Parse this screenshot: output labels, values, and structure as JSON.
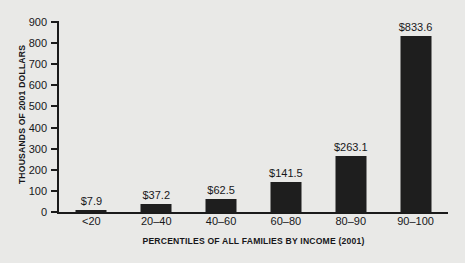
{
  "chart_data": {
    "type": "bar",
    "title": "",
    "xlabel": "PERCENTILES OF ALL FAMILIES BY INCOME (2001)",
    "ylabel": "THOUSANDS OF 2001 DOLLARS",
    "categories": [
      "<20",
      "20–40",
      "40–60",
      "60–80",
      "80–90",
      "90–100"
    ],
    "values": [
      7.9,
      37.2,
      62.5,
      141.5,
      263.1,
      833.6
    ],
    "value_labels": [
      "$7.9",
      "$37.2",
      "$62.5",
      "$141.5",
      "$263.1",
      "$833.6"
    ],
    "ylim": [
      0,
      900
    ],
    "yticks": [
      0,
      100,
      200,
      300,
      400,
      500,
      600,
      700,
      800,
      900
    ],
    "ytick_labels": [
      "0",
      "100",
      "200",
      "300",
      "400",
      "500",
      "600",
      "700",
      "800",
      "900"
    ],
    "grid": false,
    "legend": null,
    "bar_color": "#1e1e1e",
    "background_color": "#e9e9e7",
    "axis_color": "#1b1b1b"
  }
}
